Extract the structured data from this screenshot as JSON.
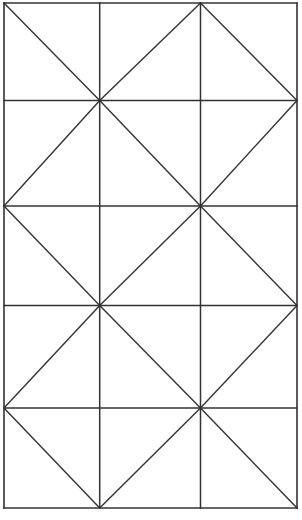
{
  "figure": {
    "type": "line-drawing",
    "canvas": {
      "width": 302,
      "height": 520,
      "background": "#ffffff"
    },
    "stroke_color": "#333333",
    "stroke_width": 1.5
  },
  "chart_data": {
    "type": "diagram",
    "columns": 3,
    "rows": 5,
    "frame": {
      "left": 4,
      "top": 3,
      "right": 297,
      "bottom": 508
    },
    "x_gridlines": [
      4,
      99.7,
      200.5,
      297
    ],
    "y_gridlines": [
      3,
      100.5,
      206,
      305.5,
      408,
      508
    ],
    "cell_diagonals": [
      [
        "\\",
        "/",
        "\\"
      ],
      [
        "/",
        "\\",
        "/"
      ],
      [
        "\\",
        "/",
        "\\"
      ],
      [
        "/",
        "\\",
        "/"
      ],
      [
        "\\",
        "/",
        "\\"
      ]
    ],
    "diagonal_legend": {
      "backslash": "top-left to bottom-right",
      "slash": "bottom-left to top-right"
    },
    "hub_points": [
      {
        "x": 99.7,
        "y": 100.5,
        "spokes": 8
      },
      {
        "x": 200.5,
        "y": 206,
        "spokes": 8
      },
      {
        "x": 99.7,
        "y": 305.5,
        "spokes": 8
      },
      {
        "x": 200.5,
        "y": 408,
        "spokes": 8
      }
    ],
    "grid": true,
    "legend": "none"
  }
}
